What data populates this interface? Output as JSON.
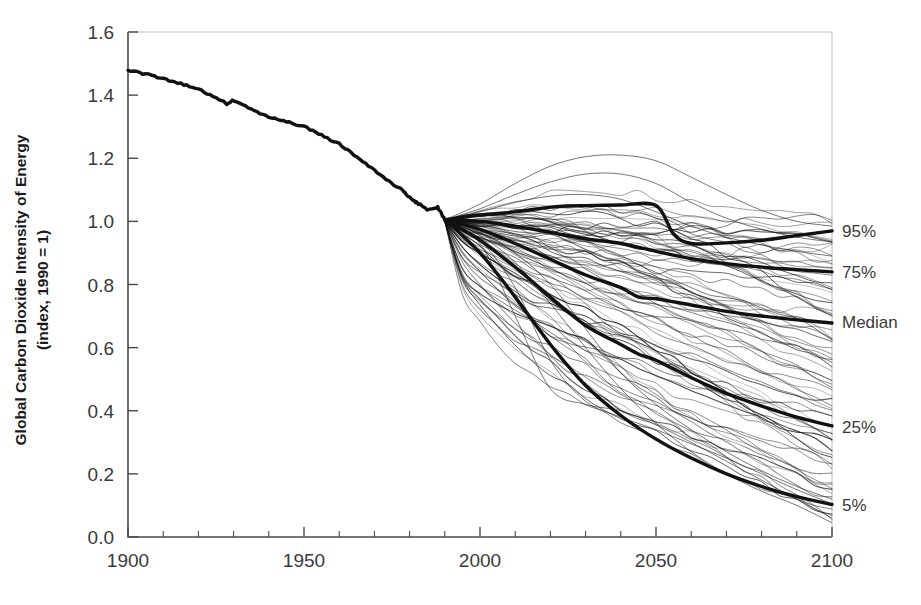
{
  "chart_data": {
    "type": "line",
    "title": "",
    "xlabel": "",
    "ylabel": "Global Carbon Dioxide Intensity of Energy (index, 1990 = 1)",
    "ylabel_line1": "Global Carbon Dioxide Intensity of Energy",
    "ylabel_line2": "(index, 1990 = 1)",
    "xlim": [
      1900,
      2100
    ],
    "ylim": [
      0.0,
      1.6
    ],
    "xticks": [
      1900,
      1950,
      2000,
      2050,
      2100
    ],
    "xtick_labels": [
      "1900",
      "1950",
      "2000",
      "2050",
      "2100"
    ],
    "xminor_step": 10,
    "yticks": [
      0.0,
      0.2,
      0.4,
      0.6,
      0.8,
      1.0,
      1.2,
      1.4,
      1.6
    ],
    "ytick_labels": [
      "0.0",
      "0.2",
      "0.4",
      "0.6",
      "0.8",
      "1.0",
      "1.2",
      "1.4",
      "1.6"
    ],
    "grid": false,
    "legend_position": "right-edge-inline",
    "line_color": "#111111",
    "background": "#ffffff",
    "historical": {
      "name": "Historical",
      "x": [
        1900,
        1905,
        1910,
        1915,
        1920,
        1925,
        1928,
        1930,
        1935,
        1940,
        1945,
        1950,
        1955,
        1960,
        1965,
        1970,
        1975,
        1978,
        1980,
        1982,
        1985,
        1988,
        1990
      ],
      "y": [
        1.48,
        1.467,
        1.452,
        1.437,
        1.418,
        1.393,
        1.372,
        1.384,
        1.356,
        1.33,
        1.318,
        1.3,
        1.272,
        1.245,
        1.205,
        1.162,
        1.12,
        1.098,
        1.075,
        1.06,
        1.038,
        1.045,
        1.005
      ]
    },
    "percentile_lines": [
      {
        "name": "95%",
        "label": "95%",
        "end_value": 0.97,
        "x": [
          1990,
          2000,
          2010,
          2020,
          2030,
          2040,
          2050,
          2055,
          2060,
          2070,
          2080,
          2090,
          2100
        ],
        "y": [
          1.005,
          1.02,
          1.03,
          1.045,
          1.05,
          1.052,
          1.05,
          0.96,
          0.93,
          0.932,
          0.94,
          0.955,
          0.97
        ]
      },
      {
        "name": "75%",
        "label": "75%",
        "end_value": 0.84,
        "x": [
          1990,
          2000,
          2010,
          2020,
          2030,
          2040,
          2050,
          2060,
          2070,
          2080,
          2090,
          2100
        ],
        "y": [
          1.005,
          1.0,
          0.985,
          0.965,
          0.945,
          0.93,
          0.905,
          0.882,
          0.866,
          0.855,
          0.847,
          0.84
        ]
      },
      {
        "name": "Median",
        "label": "Median",
        "end_value": 0.68,
        "x": [
          1990,
          2000,
          2010,
          2020,
          2030,
          2040,
          2045,
          2050,
          2060,
          2070,
          2080,
          2090,
          2100
        ],
        "y": [
          1.005,
          0.975,
          0.93,
          0.88,
          0.83,
          0.79,
          0.76,
          0.755,
          0.735,
          0.715,
          0.7,
          0.688,
          0.678
        ]
      },
      {
        "name": "25%",
        "label": "25%",
        "end_value": 0.35,
        "x": [
          1990,
          2000,
          2010,
          2020,
          2030,
          2040,
          2045,
          2050,
          2060,
          2070,
          2080,
          2090,
          2100
        ],
        "y": [
          1.005,
          0.94,
          0.855,
          0.76,
          0.67,
          0.61,
          0.58,
          0.56,
          0.505,
          0.455,
          0.415,
          0.38,
          0.352
        ]
      },
      {
        "name": "5%",
        "label": "5%",
        "end_value": 0.1,
        "x": [
          1990,
          2000,
          2010,
          2020,
          2030,
          2040,
          2050,
          2060,
          2070,
          2080,
          2090,
          2100
        ],
        "y": [
          1.005,
          0.9,
          0.76,
          0.61,
          0.48,
          0.385,
          0.31,
          0.25,
          0.2,
          0.16,
          0.128,
          0.103
        ]
      }
    ],
    "scenario_ensemble": {
      "description": "Spaghetti of individual emission-intensity scenario trajectories diverging from the 1990 index value of 1.0",
      "count": 76,
      "converge_year": 1990,
      "converge_value": 1.0,
      "end_year_range_2100": [
        0.04,
        1.01
      ],
      "max_envelope_value": 1.21,
      "max_envelope_year": 2040
    }
  },
  "right_labels": [
    {
      "text": "95%",
      "value": 0.97
    },
    {
      "text": "75%",
      "value": 0.84
    },
    {
      "text": "Median",
      "value": 0.68
    },
    {
      "text": "25%",
      "value": 0.35
    },
    {
      "text": "5%",
      "value": 0.1
    }
  ]
}
